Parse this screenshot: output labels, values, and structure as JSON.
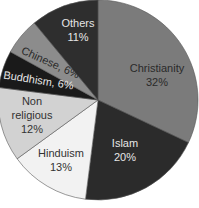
{
  "chart_data": {
    "type": "pie",
    "title": "",
    "start_angle_deg": 0,
    "direction": "clockwise",
    "slices": [
      {
        "label": "Christianity",
        "value": 32,
        "display": "32%",
        "color": "#7b7b7b",
        "text_color": "#2a2a2a",
        "label_lines": [
          "Christianity",
          "32%"
        ],
        "lx": 157,
        "ly": 72,
        "rotate": 0
      },
      {
        "label": "Islam",
        "value": 20,
        "display": "20%",
        "color": "#2b2b2b",
        "text_color": "#e6e6e6",
        "label_lines": [
          "Islam",
          "20%"
        ],
        "lx": 125,
        "ly": 147,
        "rotate": 0
      },
      {
        "label": "Hinduism",
        "value": 13,
        "display": "13%",
        "color": "#f2f2f2",
        "text_color": "#333333",
        "label_lines": [
          "Hinduism",
          "13%"
        ],
        "lx": 61,
        "ly": 157,
        "rotate": 0
      },
      {
        "label": "Non religious",
        "value": 12,
        "display": "12%",
        "color": "#d2d2d2",
        "text_color": "#333333",
        "label_lines": [
          "Non",
          "religious",
          "12%"
        ],
        "lx": 32,
        "ly": 105,
        "rotate": 0
      },
      {
        "label": "Buddhism",
        "value": 6,
        "display": "6%",
        "color": "#1a1a1a",
        "text_color": "#e6e6e6",
        "label_lines": [
          "Buddhism, 6%"
        ],
        "lx": 38,
        "ly": 84,
        "rotate": 9
      },
      {
        "label": "Chinese",
        "value": 6,
        "display": "6%",
        "color": "#8c8c8c",
        "text_color": "#2a2a2a",
        "label_lines": [
          "Chinese, 6%"
        ],
        "lx": 49,
        "ly": 66,
        "rotate": 24
      },
      {
        "label": "Others",
        "value": 11,
        "display": "11%",
        "color": "#2e2e2e",
        "text_color": "#e6e6e6",
        "label_lines": [
          "Others",
          "11%"
        ],
        "lx": 78,
        "ly": 27,
        "rotate": 0
      }
    ],
    "legend": "none",
    "labels": "inside"
  },
  "layout": {
    "cx": 98,
    "cy": 100,
    "r": 100,
    "stroke": "#ffffff",
    "outline": "#444444"
  }
}
